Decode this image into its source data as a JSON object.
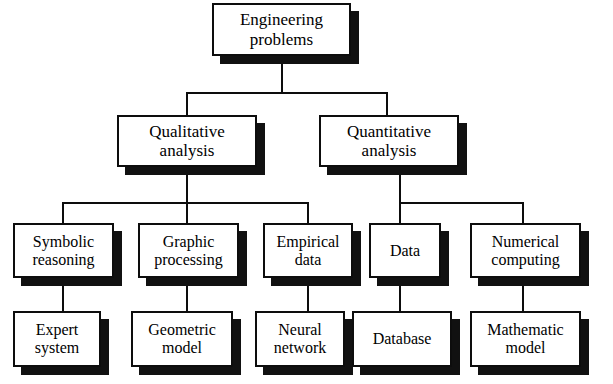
{
  "diagram": {
    "type": "tree",
    "colors": {
      "box_fill": "#ffffff",
      "box_border": "#0d0d0d",
      "shadow": "#111111",
      "connector": "#0d0d0d",
      "background": "#ffffff"
    },
    "levels": [
      {
        "level": 1,
        "nodes": [
          {
            "id": "root",
            "line1": "Engineering",
            "line2": "problems"
          }
        ]
      },
      {
        "level": 2,
        "nodes": [
          {
            "id": "qual",
            "line1": "Qualitative",
            "line2": "analysis"
          },
          {
            "id": "quant",
            "line1": "Quantitative",
            "line2": "analysis"
          }
        ]
      },
      {
        "level": 3,
        "nodes": [
          {
            "id": "symbolic",
            "line1": "Symbolic",
            "line2": "reasoning"
          },
          {
            "id": "graphic",
            "line1": "Graphic",
            "line2": "processing"
          },
          {
            "id": "empirical",
            "line1": "Empirical",
            "line2": "data"
          },
          {
            "id": "data",
            "line1": "Data",
            "line2": ""
          },
          {
            "id": "numerical",
            "line1": "Numerical",
            "line2": "computing"
          }
        ]
      },
      {
        "level": 4,
        "nodes": [
          {
            "id": "expert",
            "line1": "Expert",
            "line2": "system"
          },
          {
            "id": "geometric",
            "line1": "Geometric",
            "line2": "model"
          },
          {
            "id": "neural",
            "line1": "Neural",
            "line2": "network"
          },
          {
            "id": "database",
            "line1": "Database",
            "line2": ""
          },
          {
            "id": "mathematic",
            "line1": "Mathematic",
            "line2": "model"
          }
        ]
      }
    ],
    "edges": [
      {
        "from": "root",
        "to": "qual"
      },
      {
        "from": "root",
        "to": "quant"
      },
      {
        "from": "qual",
        "to": "symbolic"
      },
      {
        "from": "qual",
        "to": "graphic"
      },
      {
        "from": "qual",
        "to": "empirical"
      },
      {
        "from": "quant",
        "to": "data"
      },
      {
        "from": "quant",
        "to": "numerical"
      },
      {
        "from": "symbolic",
        "to": "expert"
      },
      {
        "from": "graphic",
        "to": "geometric"
      },
      {
        "from": "empirical",
        "to": "neural"
      },
      {
        "from": "data",
        "to": "database"
      },
      {
        "from": "numerical",
        "to": "mathematic"
      }
    ]
  }
}
